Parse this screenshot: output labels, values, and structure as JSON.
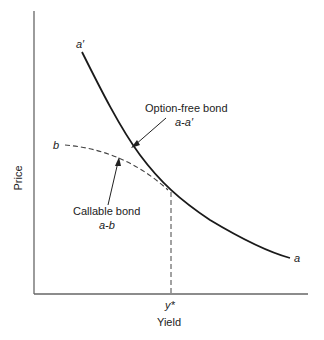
{
  "diagram": {
    "x_axis_label": "Yield",
    "y_axis_label": "Price",
    "y_star_label": "y*",
    "curves": {
      "option_free": {
        "start_label": "a′",
        "end_label": "a",
        "annotation_title": "Option-free bond",
        "annotation_subtitle": "a-a′",
        "style": "solid"
      },
      "callable": {
        "start_label": "b",
        "annotation_title": "Callable bond",
        "annotation_subtitle": "a-b",
        "style": "dashed"
      }
    },
    "colors": {
      "axis": "#555555",
      "curve": "#1a1a1a",
      "text": "#222222"
    }
  }
}
